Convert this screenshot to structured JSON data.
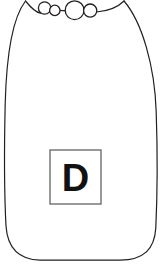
{
  "figure": {
    "kind": "line-drawing",
    "canvas": {
      "width": 162,
      "height": 265
    },
    "background_color": "#ffffff",
    "stroke_color": "#231f20",
    "stroke_width": 1.2
  },
  "body_outline": {
    "name": "bottle-body",
    "fill": "#ffffff",
    "stroke_color": "#231f20",
    "path": "M 25.5 1 C 14 16 6.5 52 5.2 104 C 4.2 148 4.5 198 6.0 226 C 7.5 248 18 259.5 40 260.2 L 120 260.2 C 144 259.8 154.5 249 155.8 228 C 157.2 198 157.5 150 156.2 112 C 154.8 66 142 22 124.0 1"
  },
  "neck_line": {
    "name": "bottle-shoulder-line",
    "path": "M 25.5 1 C 32 9 36 12.5 40.5 13.2 M 96.5 12.0 C 108 11.0 118 7.0 124.0 1",
    "stroke_color": "#231f20"
  },
  "connector_segments": [
    {
      "name": "bubble-connector-left",
      "x1": 59.8,
      "y1": 10.4,
      "x2": 65.6,
      "y2": 10.8
    }
  ],
  "bubbles": [
    {
      "name": "bubble-1",
      "cx": 44.6,
      "cy": 8.0,
      "r": 6.2
    },
    {
      "name": "bubble-2",
      "cx": 54.8,
      "cy": 10.4,
      "r": 5.2
    },
    {
      "name": "bubble-3",
      "cx": 74.6,
      "cy": 10.2,
      "r": 9.4
    },
    {
      "name": "bubble-4",
      "cx": 90.2,
      "cy": 10.6,
      "r": 6.6
    }
  ],
  "label_box": {
    "name": "label-square",
    "x": 50,
    "y": 150,
    "width": 51,
    "height": 54,
    "fill": "#ffffff",
    "stroke_color": "#6d6e71",
    "stroke_width": 1.4,
    "letter": "D",
    "letter_color": "#111111",
    "letter_font_size": 38
  }
}
